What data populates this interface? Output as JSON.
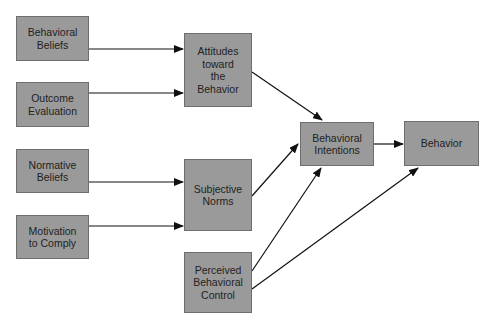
{
  "diagram": {
    "colors": {
      "box_fill": "#9a9a9a",
      "box_border": "#6e6e6e",
      "arrow": "#111111",
      "text": "#222222"
    },
    "nodes": [
      {
        "id": "behavioral-beliefs",
        "label": "Behavioral\nBeliefs",
        "x": 16,
        "y": 16,
        "w": 73,
        "h": 45
      },
      {
        "id": "outcome-evaluation",
        "label": "Outcome\nEvaluation",
        "x": 16,
        "y": 82,
        "w": 73,
        "h": 45
      },
      {
        "id": "normative-beliefs",
        "label": "Normative\nBeliefs",
        "x": 16,
        "y": 149,
        "w": 73,
        "h": 44
      },
      {
        "id": "motivation-to-comply",
        "label": "Motivation\nto Comply",
        "x": 16,
        "y": 215,
        "w": 73,
        "h": 44
      },
      {
        "id": "attitudes",
        "label": "Attitudes\ntoward\nthe\nBehavior",
        "x": 184,
        "y": 33,
        "w": 68,
        "h": 74
      },
      {
        "id": "subjective-norms",
        "label": "Subjective\nNorms",
        "x": 184,
        "y": 159,
        "w": 68,
        "h": 72
      },
      {
        "id": "perceived-control",
        "label": "Perceived\nBehavioral\nControl",
        "x": 184,
        "y": 252,
        "w": 68,
        "h": 61
      },
      {
        "id": "behavioral-intentions",
        "label": "Behavioral\nIntentions",
        "x": 300,
        "y": 122,
        "w": 74,
        "h": 44
      },
      {
        "id": "behavior",
        "label": "Behavior",
        "x": 404,
        "y": 121,
        "w": 75,
        "h": 45
      }
    ],
    "edges": [
      {
        "from": "behavioral-beliefs",
        "to": "attitudes"
      },
      {
        "from": "outcome-evaluation",
        "to": "attitudes"
      },
      {
        "from": "normative-beliefs",
        "to": "subjective-norms"
      },
      {
        "from": "motivation-to-comply",
        "to": "subjective-norms"
      },
      {
        "from": "attitudes",
        "to": "behavioral-intentions"
      },
      {
        "from": "subjective-norms",
        "to": "behavioral-intentions"
      },
      {
        "from": "perceived-control",
        "to": "behavioral-intentions"
      },
      {
        "from": "perceived-control",
        "to": "behavior"
      },
      {
        "from": "behavioral-intentions",
        "to": "behavior"
      }
    ]
  }
}
